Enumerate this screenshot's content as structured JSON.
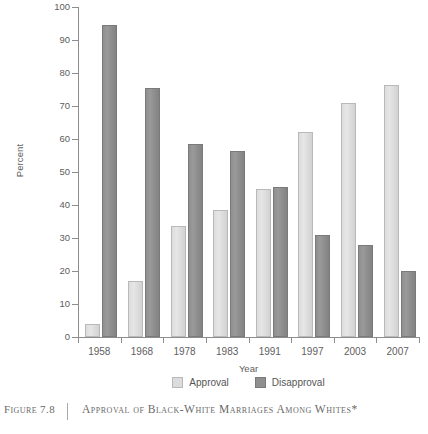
{
  "chart_data": {
    "type": "bar",
    "title": "Approval of Black-White Marriages Among Whites*",
    "xlabel": "Year",
    "ylabel": "Percent",
    "ylim": [
      0,
      100
    ],
    "yticks": [
      0,
      10,
      20,
      30,
      40,
      50,
      60,
      70,
      80,
      90,
      100
    ],
    "grid": false,
    "legend_position": "bottom-center",
    "categories": [
      "1958",
      "1968",
      "1978",
      "1983",
      "1991",
      "1997",
      "2003",
      "2007"
    ],
    "series": [
      {
        "name": "Approval",
        "color": "#dcdcdc",
        "values": [
          4,
          17,
          33.5,
          38.5,
          45,
          62,
          71,
          76.5
        ]
      },
      {
        "name": "Disapproval",
        "color": "#8f8f8f",
        "values": [
          94.5,
          75.5,
          58.5,
          56.5,
          45.5,
          31,
          28,
          20
        ]
      }
    ]
  },
  "caption": {
    "figure_number": "Figure 7.8",
    "title": "Approval of Black-White Marriages Among Whites*"
  }
}
